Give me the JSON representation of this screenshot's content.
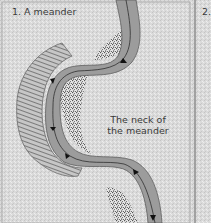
{
  "diagram": {
    "panel1": {
      "title": "1. A meander",
      "neck_label_line1": "The neck of",
      "neck_label_line2": "the meander",
      "elements": [
        "river channel",
        "flow arrows",
        "river cliff (eroded outer bank)",
        "slip-off slope deposits (inner bank)"
      ]
    },
    "panel2": {
      "title": "2."
    },
    "colors": {
      "background": "#d9d9d9",
      "river": "#9a9a9a",
      "deposit": "#6e6e6e",
      "cliff": "#bdbdbd",
      "line": "#333333"
    }
  }
}
